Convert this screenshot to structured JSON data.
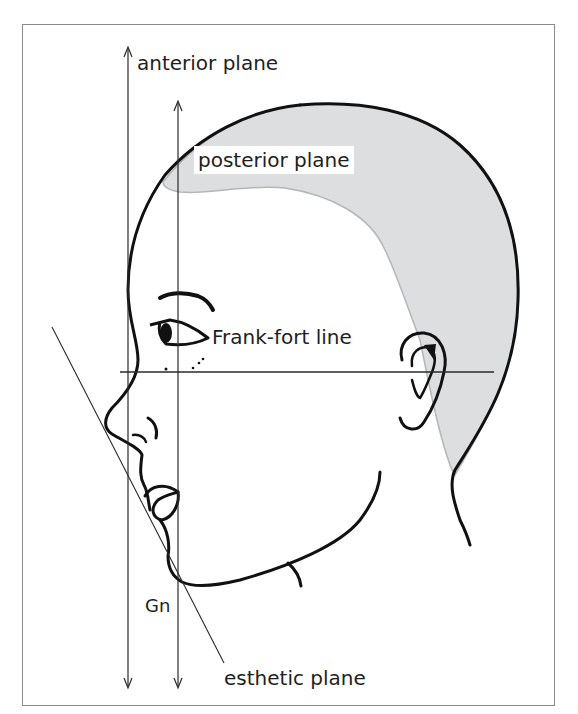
{
  "figure": {
    "colors": {
      "hair_fill": "#dcdee0",
      "hair_edge": "#b4b6b8",
      "outline": "#111111",
      "reference_lines": "#2a2a2a",
      "frame_border": "#8a8a8a"
    },
    "labels": {
      "anterior_plane": "anterior plane",
      "posterior_plane": "posterior plane",
      "frankfort_line": "Frank-fort line",
      "gn": "Gn",
      "esthetic_plane": "esthetic plane"
    },
    "reference_lines": [
      {
        "name": "anterior plane",
        "type": "vertical double-arrow",
        "x": 128,
        "y_top": 47,
        "y_bottom": 688
      },
      {
        "name": "posterior plane",
        "type": "vertical double-arrow",
        "x": 178,
        "y_top": 101,
        "y_bottom": 688
      },
      {
        "name": "Frank-fort line",
        "type": "horizontal line",
        "y": 372,
        "x_start": 120,
        "x_end": 494
      },
      {
        "name": "esthetic plane",
        "type": "oblique line",
        "x1": 52,
        "y1": 327,
        "x2": 224,
        "y2": 663
      }
    ],
    "landmarks": [
      {
        "name": "Gn",
        "x": 180,
        "y": 580
      }
    ]
  }
}
